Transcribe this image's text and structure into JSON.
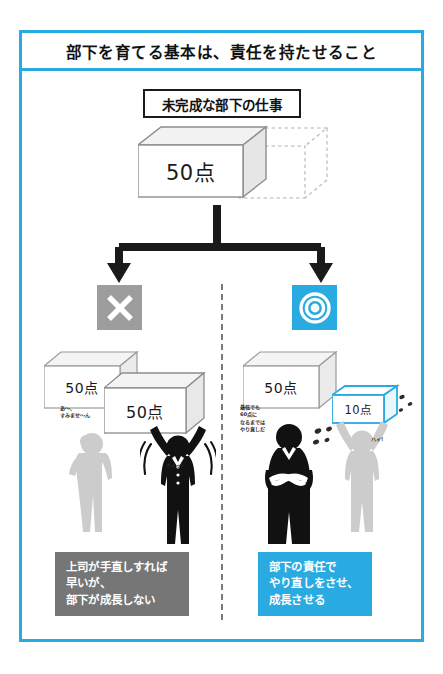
{
  "page": {
    "title": "部下を育てる基本は、責任を持たせること",
    "subheading": "未完成な部下の仕事",
    "accent_color": "#29abe2",
    "gray_color": "#767676",
    "badge_gray": "#9d9d9d"
  },
  "main_box": {
    "label": "50点",
    "ghost_label": ""
  },
  "branches": {
    "left": {
      "badge_icon": "cross-icon",
      "badge_symbol": "✕",
      "badge_color": "#9d9d9d",
      "boxes": [
        {
          "label": "50点"
        },
        {
          "label": "50点"
        }
      ],
      "speech_subordinate": "あ〜、\nすみませ〜ん",
      "speech_boss": "ホイッ!",
      "caption_lines": [
        "上司が手直しすれば",
        "早いが、",
        "部下が成長しない"
      ],
      "caption_color": "#767676"
    },
    "right": {
      "badge_icon": "double-circle-icon",
      "badge_symbol": "◎",
      "badge_color": "#29abe2",
      "boxes": [
        {
          "label": "50点"
        },
        {
          "label": "10点"
        }
      ],
      "speech_boss": "最低でも\n60点に\nなるまでは\nやり直しだ",
      "speech_subordinate": "ハイ!",
      "caption_lines": [
        "部下の責任で",
        "やり直しをさせ、",
        "成長させる"
      ],
      "caption_color": "#29abe2"
    }
  }
}
